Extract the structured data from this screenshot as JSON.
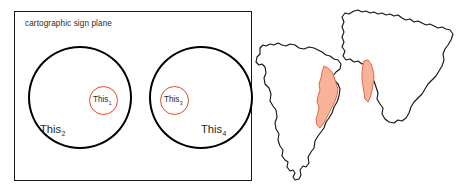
{
  "diagram": {
    "panel": {
      "title": "cartographic sign plane"
    },
    "sets": [
      {
        "id": "this2",
        "label": "This",
        "subscript": "2",
        "role": "outer-set-left",
        "shape": "circle",
        "stroke": "#000000"
      },
      {
        "id": "this1",
        "label": "This",
        "subscript": "1",
        "role": "inner-set-left",
        "shape": "circle",
        "stroke": "#ea4327"
      },
      {
        "id": "this3",
        "label": "This",
        "subscript": "3",
        "role": "inner-set-right",
        "shape": "circle",
        "stroke": "#ea4327"
      },
      {
        "id": "this4",
        "label": "This",
        "subscript": "4",
        "role": "outer-set-right",
        "shape": "circle",
        "stroke": "#000000"
      }
    ],
    "maps": [
      {
        "id": "south-america",
        "name": "South America",
        "highlight_region": "eastern coastal strip"
      },
      {
        "id": "africa",
        "name": "Africa",
        "highlight_region": "western coastal strip"
      }
    ]
  },
  "colors": {
    "outline": "#000000",
    "accent_red": "#ea4327",
    "highlight_fill": "#f8b49a",
    "highlight_stroke": "#e06a4a",
    "panel_border": "#1a1a1a",
    "text": "#262626",
    "background": "#ffffff"
  }
}
